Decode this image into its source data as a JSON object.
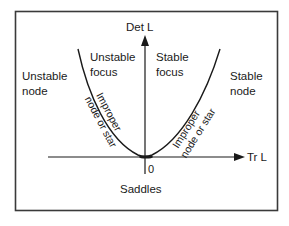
{
  "diagram": {
    "axes": {
      "y_label": "Det L",
      "x_label": "Tr L",
      "origin_label": "0"
    },
    "regions": {
      "unstable_node": [
        "Unstable",
        "node"
      ],
      "unstable_focus": [
        "Unstable",
        "focus"
      ],
      "stable_focus": [
        "Stable",
        "focus"
      ],
      "stable_node": [
        "Stable",
        "node"
      ],
      "saddles": "Saddles"
    },
    "curve_labels": {
      "left": [
        "Improper",
        "node or star"
      ],
      "right": [
        "Improper",
        "node or star"
      ]
    },
    "colors": {
      "ink": "#1a1a1a",
      "frame": "#3a3a3a",
      "background": "#ffffff"
    }
  }
}
